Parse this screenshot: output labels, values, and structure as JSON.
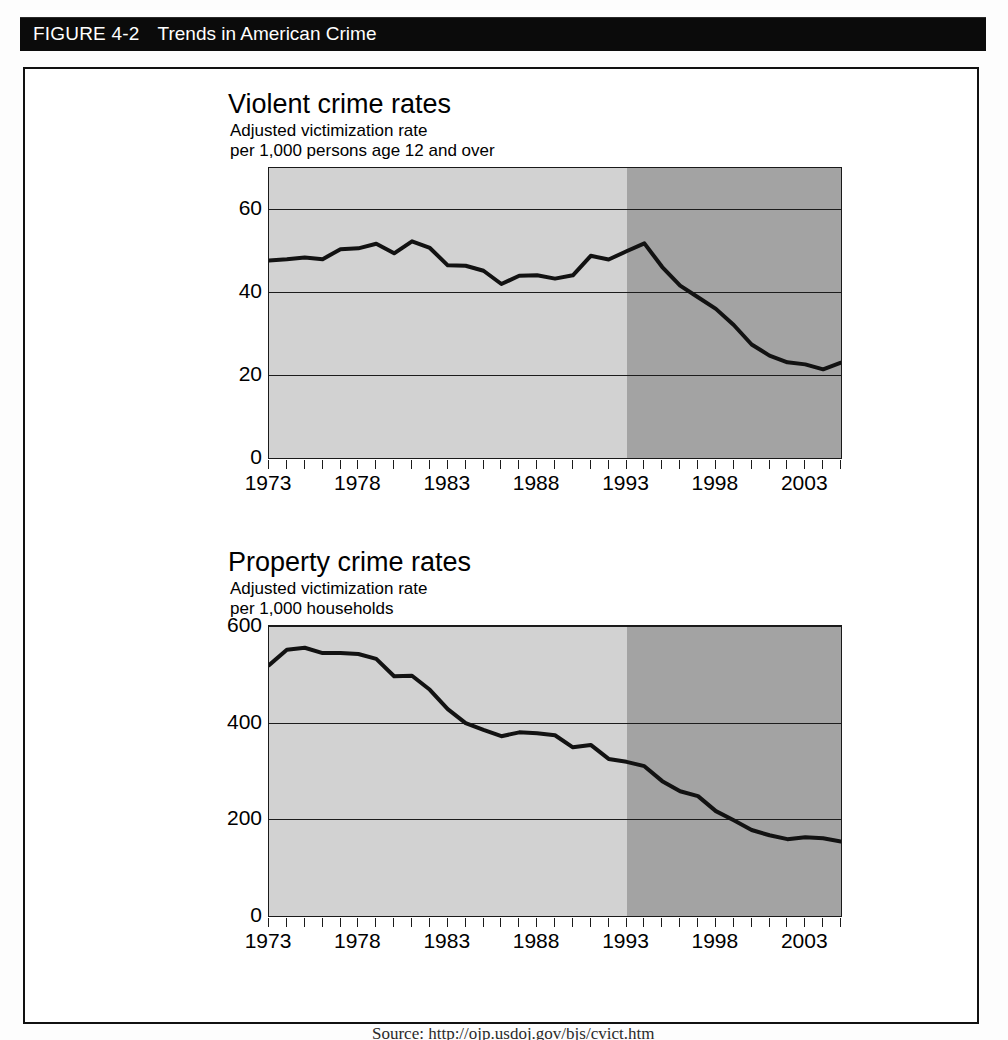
{
  "banner": {
    "figure_number": "FIGURE 4-2",
    "title": "Trends in American Crime"
  },
  "caption": {
    "text": "Source: http://ojp.usdoj.gov/bjs/cvict.htm"
  },
  "charts": [
    {
      "id": "violent",
      "title": "Violent crime rates",
      "subtitle_line1": "Adjusted victimization rate",
      "subtitle_line2": "per 1,000 persons age 12 and over"
    },
    {
      "id": "property",
      "title": "Property crime rates",
      "subtitle_line1": "Adjusted victimization rate",
      "subtitle_line2": "per 1,000 households"
    }
  ],
  "chart_data": [
    {
      "type": "line",
      "title": "Violent crime rates",
      "subtitle": "Adjusted victimization rate per 1,000 persons age 12 and over",
      "xlabel": "",
      "ylabel": "Rate per 1,000 persons age 12 and over",
      "xlim": [
        1973,
        2005
      ],
      "ylim": [
        0,
        70
      ],
      "yticks": [
        0,
        20,
        40,
        60
      ],
      "ytick_labels": [
        "0",
        "20",
        "40",
        "60"
      ],
      "xticks": [
        1973,
        1974,
        1975,
        1976,
        1977,
        1978,
        1979,
        1980,
        1981,
        1982,
        1983,
        1984,
        1985,
        1986,
        1987,
        1988,
        1989,
        1990,
        1991,
        1992,
        1993,
        1994,
        1995,
        1996,
        1997,
        1998,
        1999,
        2000,
        2001,
        2002,
        2003,
        2004,
        2005
      ],
      "xtick_labels_shown": [
        "1973",
        "1978",
        "1983",
        "1988",
        "1993",
        "1998",
        "2003"
      ],
      "grid": true,
      "legend": "none",
      "shaded_regions": [
        {
          "from": 1973,
          "to": 1993,
          "shade": "light",
          "color": "#d2d2d2"
        },
        {
          "from": 1993,
          "to": 2005,
          "shade": "dark",
          "color": "#a3a3a3"
        }
      ],
      "x": [
        1973,
        1974,
        1975,
        1976,
        1977,
        1978,
        1979,
        1980,
        1981,
        1982,
        1983,
        1984,
        1985,
        1986,
        1987,
        1988,
        1989,
        1990,
        1991,
        1992,
        1993,
        1994,
        1995,
        1996,
        1997,
        1998,
        1999,
        2000,
        2001,
        2002,
        2003,
        2004,
        2005
      ],
      "values": [
        47.7,
        48.0,
        48.4,
        48.0,
        50.4,
        50.6,
        51.7,
        49.4,
        52.3,
        50.7,
        46.5,
        46.4,
        45.2,
        42.0,
        44.0,
        44.1,
        43.3,
        44.1,
        48.8,
        47.9,
        49.9,
        51.8,
        46.1,
        41.6,
        38.8,
        36.0,
        32.1,
        27.4,
        24.7,
        23.1,
        22.6,
        21.4,
        23.0
      ]
    },
    {
      "type": "line",
      "title": "Property crime rates",
      "subtitle": "Adjusted victimization rate per 1,000 households",
      "xlabel": "",
      "ylabel": "Rate per 1,000 households",
      "xlim": [
        1973,
        2005
      ],
      "ylim": [
        0,
        600
      ],
      "yticks": [
        0,
        200,
        400,
        600
      ],
      "ytick_labels": [
        "0",
        "200",
        "400",
        "600"
      ],
      "xticks": [
        1973,
        1974,
        1975,
        1976,
        1977,
        1978,
        1979,
        1980,
        1981,
        1982,
        1983,
        1984,
        1985,
        1986,
        1987,
        1988,
        1989,
        1990,
        1991,
        1992,
        1993,
        1994,
        1995,
        1996,
        1997,
        1998,
        1999,
        2000,
        2001,
        2002,
        2003,
        2004,
        2005
      ],
      "xtick_labels_shown": [
        "1973",
        "1978",
        "1983",
        "1988",
        "1993",
        "1998",
        "2003"
      ],
      "grid": true,
      "legend": "none",
      "shaded_regions": [
        {
          "from": 1973,
          "to": 1993,
          "shade": "light",
          "color": "#d2d2d2"
        },
        {
          "from": 1993,
          "to": 2005,
          "shade": "dark",
          "color": "#a3a3a3"
        }
      ],
      "x": [
        1973,
        1974,
        1975,
        1976,
        1977,
        1978,
        1979,
        1980,
        1981,
        1982,
        1983,
        1984,
        1985,
        1986,
        1987,
        1988,
        1989,
        1990,
        1991,
        1992,
        1993,
        1994,
        1995,
        1996,
        1997,
        1998,
        1999,
        2000,
        2001,
        2002,
        2003,
        2004,
        2005
      ],
      "values": [
        519,
        551,
        555,
        544,
        544,
        542,
        532,
        496,
        497,
        468,
        428,
        399,
        385,
        372,
        380,
        378,
        374,
        349,
        354,
        325,
        319,
        310,
        279,
        258,
        248,
        217,
        198,
        178,
        167,
        159,
        163,
        161,
        154
      ]
    }
  ]
}
